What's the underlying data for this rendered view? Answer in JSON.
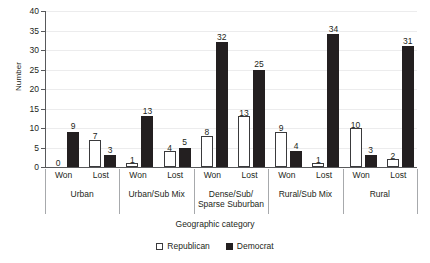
{
  "chart_data": {
    "type": "bar",
    "title": "",
    "subtitle": "",
    "xlabel": "Geographic category",
    "ylabel": "Number",
    "ylim": [
      0,
      40
    ],
    "yticks": [
      0,
      5,
      10,
      15,
      20,
      25,
      30,
      35,
      40
    ],
    "grid": true,
    "legend_position": "bottom",
    "categories": [
      "Won",
      "Lost",
      "Won",
      "Lost",
      "Won",
      "Lost",
      "Won",
      "Lost",
      "Won",
      "Lost"
    ],
    "groups": [
      {
        "label": "Urban",
        "label_lines": [
          "Urban"
        ],
        "bars": [
          {
            "tick": "Won",
            "republican": 0,
            "democrat": 9
          },
          {
            "tick": "Lost",
            "republican": 7,
            "democrat": 3
          }
        ]
      },
      {
        "label": "Urban/Sub Mix",
        "label_lines": [
          "Urban/Sub Mix"
        ],
        "bars": [
          {
            "tick": "Won",
            "republican": 1,
            "democrat": 13
          },
          {
            "tick": "Lost",
            "republican": 4,
            "democrat": 5
          }
        ]
      },
      {
        "label": "Dense/Sub/ Sparse Suburban",
        "label_lines": [
          "Dense/Sub/",
          "Sparse Suburban"
        ],
        "bars": [
          {
            "tick": "Won",
            "republican": 8,
            "democrat": 32
          },
          {
            "tick": "Lost",
            "republican": 13,
            "democrat": 25
          }
        ]
      },
      {
        "label": "Rural/Sub Mix",
        "label_lines": [
          "Rural/Sub Mix"
        ],
        "bars": [
          {
            "tick": "Won",
            "republican": 9,
            "democrat": 4
          },
          {
            "tick": "Lost",
            "republican": 1,
            "democrat": 34
          }
        ]
      },
      {
        "label": "Rural",
        "label_lines": [
          "Rural"
        ],
        "bars": [
          {
            "tick": "Won",
            "republican": 10,
            "democrat": 3
          },
          {
            "tick": "Lost",
            "republican": 2,
            "democrat": 31
          }
        ]
      }
    ],
    "series": [
      {
        "name": "Republican",
        "color": "#ffffff",
        "edge_color": "#3a3a3c",
        "values": [
          0,
          7,
          1,
          4,
          8,
          13,
          9,
          1,
          10,
          2
        ]
      },
      {
        "name": "Democrat",
        "color": "#231f20",
        "edge_color": "#231f20",
        "values": [
          9,
          3,
          13,
          5,
          32,
          25,
          4,
          34,
          3,
          31
        ]
      }
    ]
  },
  "legend": {
    "items": [
      {
        "label": "Republican",
        "swatch": "open-square-icon"
      },
      {
        "label": "Democrat",
        "swatch": "filled-square-icon"
      }
    ]
  },
  "colors": {
    "republican": "#ffffff",
    "democrat": "#231f20",
    "axis": "#58595b",
    "grid": "#ececed",
    "separator": "#a7a9ac",
    "text": "#231f20"
  }
}
